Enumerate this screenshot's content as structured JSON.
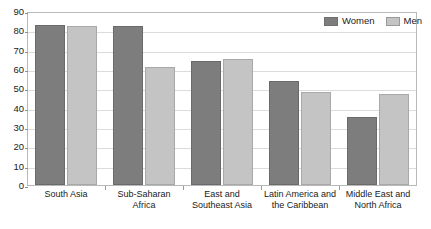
{
  "chart_data": {
    "type": "bar",
    "title": "",
    "xlabel": "",
    "ylabel": "",
    "ylim": [
      0,
      90
    ],
    "y_ticks": [
      0,
      10,
      20,
      30,
      40,
      50,
      60,
      70,
      80,
      90
    ],
    "grid": true,
    "legend_position": "top-right",
    "categories": [
      "South Asia",
      "Sub-Saharan Africa",
      "East and Southeast Asia",
      "Latin America and the Caribbean",
      "Middle East and North Africa"
    ],
    "category_label_lines": [
      [
        "South Asia"
      ],
      [
        "Sub-Saharan",
        "Africa"
      ],
      [
        "East and",
        "Southeast Asia"
      ],
      [
        "Latin America and",
        "the Caribbean"
      ],
      [
        "Middle East and",
        "North Africa"
      ]
    ],
    "series": [
      {
        "name": "Women",
        "color": "#7d7d7d",
        "values": [
          83,
          82,
          64,
          54,
          35
        ]
      },
      {
        "name": "Men",
        "color": "#c4c4c4",
        "values": [
          82,
          61,
          65,
          48,
          47
        ]
      }
    ]
  },
  "legend": {
    "items": [
      {
        "label": "Women"
      },
      {
        "label": "Men"
      }
    ]
  }
}
